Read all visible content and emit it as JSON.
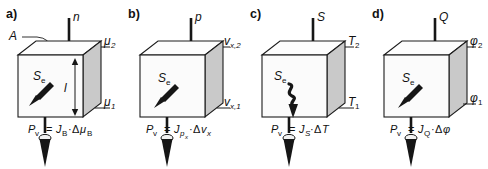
{
  "figure": {
    "caption_type": "physics-analogy-diagram",
    "panel_count": 4,
    "symbol_entropy_produced": "S",
    "symbol_entropy_sub": "e",
    "symbol_length": "l",
    "symbol_area": "A",
    "power_symbol": "P",
    "power_sub": "v",
    "equals": "=",
    "delta": "Δ",
    "dot": "·"
  },
  "panels": [
    {
      "letter": "a)",
      "top_quantity": "n",
      "top_quantity_sub": "",
      "area_label": "A",
      "length_label": "l",
      "entropy_label": "S",
      "entropy_sub": "e",
      "upper_potential": "μ",
      "upper_potential_sub": "2",
      "lower_potential": "μ",
      "lower_potential_sub": "1",
      "eq_power": "P",
      "eq_power_sub": "v",
      "eq_equals": "=",
      "eq_flux": "J",
      "eq_flux_sub": "B",
      "eq_dot": "·",
      "eq_delta": "Δ",
      "eq_potential": "μ",
      "eq_potential_sub": "B",
      "has_area_leader": true,
      "has_length_dim": true,
      "arrow_style": "straight"
    },
    {
      "letter": "b)",
      "top_quantity": "p",
      "top_quantity_sub": "",
      "area_label": "",
      "length_label": "",
      "entropy_label": "S",
      "entropy_sub": "e",
      "upper_potential": "v",
      "upper_potential_sub": "x,2",
      "lower_potential": "v",
      "lower_potential_sub": "x,1",
      "eq_power": "P",
      "eq_power_sub": "v",
      "eq_equals": "=",
      "eq_flux": "J",
      "eq_flux_sub": "p",
      "eq_flux_sub_sub": "x",
      "eq_dot": "·",
      "eq_delta": "Δ",
      "eq_potential": "v",
      "eq_potential_sub": "x",
      "has_area_leader": false,
      "has_length_dim": false,
      "arrow_style": "straight"
    },
    {
      "letter": "c)",
      "top_quantity": "S",
      "top_quantity_sub": "",
      "area_label": "",
      "length_label": "",
      "entropy_label": "S",
      "entropy_sub": "e",
      "upper_potential": "T",
      "upper_potential_sub": "2",
      "lower_potential": "T",
      "lower_potential_sub": "1",
      "eq_power": "P",
      "eq_power_sub": "v",
      "eq_equals": "=",
      "eq_flux": "J",
      "eq_flux_sub": "S",
      "eq_dot": "·",
      "eq_delta": "Δ",
      "eq_potential": "T",
      "eq_potential_sub": "",
      "has_area_leader": false,
      "has_length_dim": false,
      "arrow_style": "squiggle"
    },
    {
      "letter": "d)",
      "top_quantity": "Q",
      "top_quantity_sub": "",
      "area_label": "",
      "length_label": "",
      "entropy_label": "S",
      "entropy_sub": "e",
      "upper_potential": "φ",
      "upper_potential_sub": "2",
      "lower_potential": "φ",
      "lower_potential_sub": "1",
      "eq_power": "P",
      "eq_power_sub": "v",
      "eq_equals": "=",
      "eq_flux": "J",
      "eq_flux_sub": "Q",
      "eq_dot": "·",
      "eq_delta": "Δ",
      "eq_potential": "φ",
      "eq_potential_sub": "",
      "has_area_leader": false,
      "has_length_dim": false,
      "arrow_style": "straight"
    }
  ],
  "colors": {
    "ink": "#161616",
    "side_face": "#c9c9c9",
    "front_face": "#fbfbfb",
    "background": "#ffffff"
  }
}
